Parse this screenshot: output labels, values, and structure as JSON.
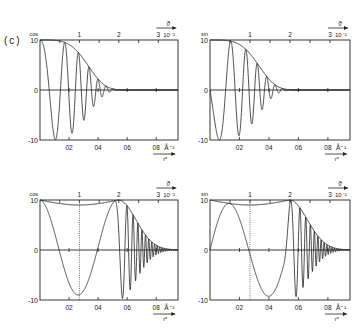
{
  "figure_label": "(c)",
  "chart_data": [
    {
      "type": "line",
      "panel": "top-left",
      "ylabel": "cos",
      "xlabel": "r*",
      "x_unit": "Å⁻¹",
      "top_axis_label": "ϑ",
      "top_axis_unit": "10⁻²",
      "ylim": [
        -10,
        10
      ],
      "xlim": [
        0,
        0.95
      ],
      "yticks": [
        "10",
        "0",
        "-10"
      ],
      "xticks": [
        "0.2",
        "0.4",
        "0.6",
        "0.8"
      ],
      "top_ticks": [
        "1",
        "2",
        "3"
      ],
      "series": [
        {
          "name": "envelope",
          "kind": "gaussian",
          "amplitude": 10,
          "x_half": 0.4
        },
        {
          "name": "oscillation",
          "kind": "cos",
          "amplitude": 10,
          "phase": "cos",
          "chirp": "quadratic",
          "minima": [
            [
              0.17,
              -10
            ],
            [
              0.34,
              -7
            ]
          ],
          "decay_end": 0.58
        }
      ]
    },
    {
      "type": "line",
      "panel": "top-right",
      "ylabel": "sin",
      "xlabel": "r*",
      "x_unit": "Å⁻¹",
      "top_axis_label": "ϑ",
      "top_axis_unit": "10⁻²",
      "ylim": [
        -10,
        10
      ],
      "xlim": [
        0,
        0.95
      ],
      "yticks": [
        "10",
        "0",
        "-10"
      ],
      "xticks": [
        "0.2",
        "0.4",
        "0.6",
        "0.8"
      ],
      "top_ticks": [
        "1",
        "2",
        "3"
      ],
      "series": [
        {
          "name": "envelope",
          "kind": "gaussian",
          "amplitude": 10,
          "x_half": 0.4
        },
        {
          "name": "oscillation",
          "kind": "sin",
          "amplitude": 10,
          "phase": "sin",
          "chirp": "quadratic",
          "minima": [
            [
              0.12,
              -10
            ],
            [
              0.35,
              -6
            ]
          ],
          "decay_end": 0.58
        }
      ]
    },
    {
      "type": "line",
      "panel": "bottom-left",
      "ylabel": "cos",
      "xlabel": "r*",
      "x_unit": "Å⁻¹",
      "top_axis_label": "ϑ",
      "top_axis_unit": "10⁻²",
      "ylim": [
        -10,
        10
      ],
      "xlim": [
        0,
        0.95
      ],
      "yticks": [
        "10",
        "0",
        "-10"
      ],
      "xticks": [
        "0.2",
        "0.4",
        "0.6",
        "0.8"
      ],
      "top_ticks": [
        "1",
        "2",
        "3"
      ],
      "dotted_marker_at_top_tick": "1",
      "series": [
        {
          "name": "envelope",
          "kind": "dip-then-gaussian",
          "amplitude": 10,
          "dip_min": 9,
          "dip_center": 0.27,
          "decay_start": 0.55
        },
        {
          "name": "oscillation",
          "kind": "cos",
          "amplitude": 10,
          "minima": [
            [
              0.15,
              -9
            ],
            [
              0.37,
              -9
            ],
            [
              0.6,
              -9
            ]
          ],
          "decay_end": 0.8
        }
      ]
    },
    {
      "type": "line",
      "panel": "bottom-right",
      "ylabel": "sin",
      "xlabel": "r*",
      "x_unit": "Å⁻¹",
      "top_axis_label": "ϑ",
      "top_axis_unit": "10⁻²",
      "ylim": [
        -10,
        10
      ],
      "xlim": [
        0,
        0.95
      ],
      "yticks": [
        "10",
        "0",
        "-10"
      ],
      "xticks": [
        "0.2",
        "0.4",
        "0.6",
        "0.8"
      ],
      "top_ticks": [
        "1",
        "2",
        "3"
      ],
      "dotted_marker_at_top_tick": "1",
      "series": [
        {
          "name": "envelope",
          "kind": "dip-then-gaussian",
          "amplitude": 10,
          "dip_min": 9,
          "dip_center": 0.27,
          "decay_start": 0.55
        },
        {
          "name": "oscillation",
          "kind": "sin",
          "amplitude": 10,
          "minima": [
            [
              0.27,
              -9
            ],
            [
              0.62,
              -8
            ]
          ],
          "decay_end": 0.8
        }
      ]
    }
  ]
}
